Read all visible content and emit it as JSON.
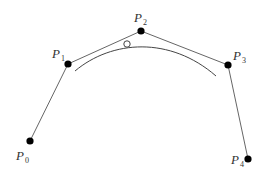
{
  "diagram": {
    "type": "bezier-control-polygon",
    "colors": {
      "polygon": "#666666",
      "curve": "#444444",
      "point": "#000000",
      "label": "#333333",
      "marker_fill": "#ffffff"
    },
    "control_points": [
      {
        "name": "P",
        "sub": "0",
        "x": 30,
        "y": 141,
        "lx": 16,
        "ly": 160
      },
      {
        "name": "P",
        "sub": "1",
        "x": 68,
        "y": 64,
        "lx": 52,
        "ly": 58
      },
      {
        "name": "P",
        "sub": "2",
        "x": 141,
        "y": 31,
        "lx": 134,
        "ly": 22
      },
      {
        "name": "P",
        "sub": "3",
        "x": 228,
        "y": 65,
        "lx": 233,
        "ly": 60
      },
      {
        "name": "P",
        "sub": "4",
        "x": 248,
        "y": 159,
        "lx": 231,
        "ly": 164
      }
    ],
    "curve": {
      "start": [
        75,
        71
      ],
      "c1": [
        112,
        40
      ],
      "c2": [
        170,
        36
      ],
      "end": [
        216,
        76
      ]
    },
    "marker": {
      "x": 127,
      "y": 44,
      "r": 3.2,
      "style": "open-circle"
    }
  }
}
